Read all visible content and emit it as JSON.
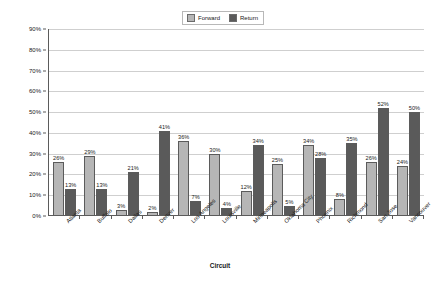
{
  "chart_data": {
    "type": "bar",
    "title": "",
    "xlabel": "Circuit",
    "ylabel": "Percent Utilization",
    "ylim": [
      0,
      90
    ],
    "ytick_labels": [
      "90%",
      "80%",
      "70%",
      "60%",
      "50%",
      "40%",
      "30%",
      "20%",
      "10%",
      "0%"
    ],
    "ytick_values": [
      90,
      80,
      70,
      60,
      50,
      40,
      30,
      20,
      10,
      0
    ],
    "grid": true,
    "legend_position": "top-center",
    "categories": [
      "Atlanta",
      "Buffalo",
      "Dallas",
      "Denver",
      "Los Angeles",
      "Louisville",
      "Minneapolis",
      "Oklahoma City",
      "Phoenix",
      "Richmond",
      "San Jose",
      "Vancouver"
    ],
    "series": [
      {
        "name": "Forward",
        "color": "#b6b6b6",
        "values": [
          26,
          29,
          3,
          2,
          36,
          30,
          12,
          25,
          34,
          8,
          26,
          24
        ],
        "labels": [
          "26%",
          "29%",
          "3%",
          "2%",
          "36%",
          "30%",
          "12%",
          "25%",
          "34%",
          "8%",
          "26%",
          "24%"
        ]
      },
      {
        "name": "Return",
        "color": "#5a5a5a",
        "values": [
          13,
          13,
          21,
          41,
          7,
          4,
          34,
          5,
          28,
          35,
          52,
          50
        ],
        "labels": [
          "13%",
          "13%",
          "21%",
          "41%",
          "7%",
          "4%",
          "34%",
          "5%",
          "28%",
          "35%",
          "52%",
          "50%"
        ]
      }
    ]
  },
  "legend": {
    "entries": [
      {
        "label": "Forward",
        "swatch": "forward-swatch-icon"
      },
      {
        "label": "Return",
        "swatch": "return-swatch-icon"
      }
    ]
  },
  "axes": {
    "y_title": "Percent Utilization",
    "x_title": "Circuit"
  }
}
